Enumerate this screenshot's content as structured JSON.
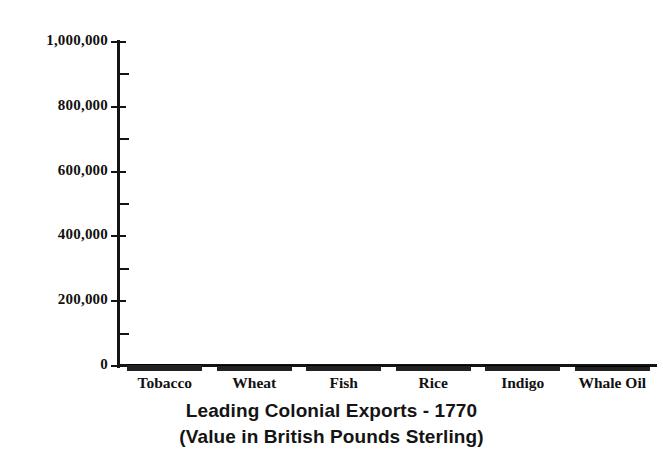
{
  "chart_data": {
    "type": "bar",
    "title": "Leading Colonial Exports - 1770",
    "subtitle": "(Value in British Pounds Sterling)",
    "xlabel": "",
    "ylabel": "",
    "ylim": [
      0,
      1000000
    ],
    "grid": false,
    "legend": "none",
    "y_ticks_major": [
      0,
      200000,
      400000,
      600000,
      800000,
      1000000
    ],
    "y_tick_labels": [
      "0",
      "200,000",
      "400,000",
      "600,000",
      "800,000",
      "1,000,000"
    ],
    "y_ticks_minor": [
      100000,
      300000,
      500000,
      700000,
      900000
    ],
    "categories": [
      "Tobacco",
      "Wheat",
      "Fish",
      "Rice",
      "Indigo",
      "Whale Oil"
    ],
    "values": [
      18000,
      16000,
      15000,
      14000,
      14000,
      13000
    ],
    "bar_color": "#222222",
    "axis_color": "#141414"
  },
  "colors": {
    "background": "#ffffff",
    "ink": "#111111",
    "bar": "#222222",
    "axis": "#141414"
  }
}
